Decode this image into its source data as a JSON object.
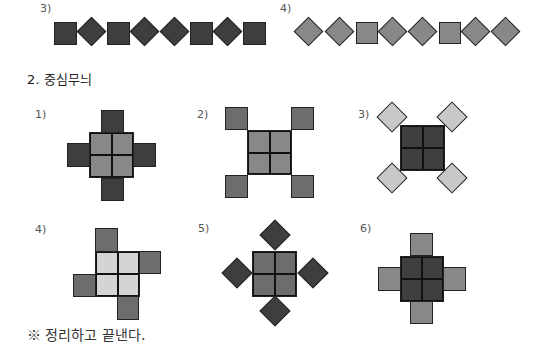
{
  "row_top": {
    "pattern3_label": "3)",
    "pattern4_label": "4)"
  },
  "section": {
    "title": "2. 중심무늬"
  },
  "patterns": [
    {
      "label": "1)"
    },
    {
      "label": "2)"
    },
    {
      "label": "3)"
    },
    {
      "label": "4)"
    },
    {
      "label": "5)"
    },
    {
      "label": "6)"
    }
  ],
  "note": "※ 정리하고 끝낸다.",
  "colors": {
    "dark": "#3e3e3e",
    "mid": "#6d6d6d",
    "grey": "#888888",
    "light": "#c8c8c8"
  }
}
